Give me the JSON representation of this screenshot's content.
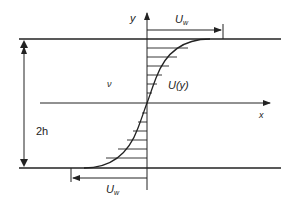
{
  "diagram": {
    "labels": {
      "y_axis": "y",
      "x_axis": "x",
      "viscosity": "ν",
      "profile": "U(y)",
      "gap": "2h",
      "top_wall_velocity": {
        "main": "U",
        "sub": "w"
      },
      "bottom_wall_velocity": {
        "main": "U",
        "sub": "w"
      }
    },
    "colors": {
      "line": "#222222",
      "background": "#ffffff"
    }
  }
}
